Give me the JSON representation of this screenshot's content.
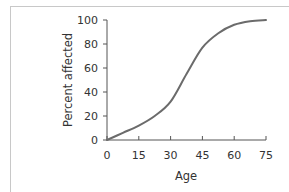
{
  "chart_data": {
    "type": "line",
    "title": "",
    "xlabel": "Age",
    "ylabel": "Percent affected",
    "xlim": [
      0,
      75
    ],
    "ylim": [
      0,
      100
    ],
    "x_ticks": [
      "0",
      "15",
      "30",
      "45",
      "60",
      "75"
    ],
    "y_ticks": [
      "0",
      "20",
      "40",
      "60",
      "80",
      "100"
    ],
    "grid": false,
    "legend": null,
    "series": [
      {
        "name": "Percent affected",
        "color": "#6b6b6b",
        "x": [
          0,
          7.5,
          15,
          22.5,
          30,
          37.5,
          45,
          52.5,
          60,
          67.5,
          75
        ],
        "y": [
          0,
          6,
          12,
          20,
          32,
          55,
          77,
          89,
          96,
          99,
          100
        ]
      }
    ]
  }
}
